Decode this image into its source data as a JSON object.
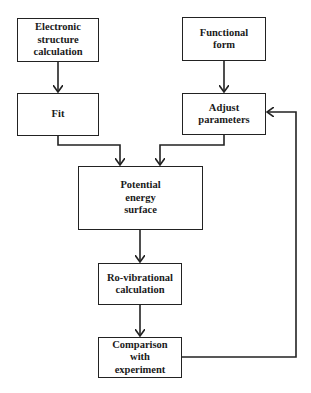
{
  "diagram": {
    "type": "flowchart",
    "nodes": [
      {
        "id": "electronic",
        "label": "Electronic\nstructure\ncalculation"
      },
      {
        "id": "functional",
        "label": "Functional\nform"
      },
      {
        "id": "fit",
        "label": "Fit"
      },
      {
        "id": "adjust",
        "label": "Adjust\nparameters"
      },
      {
        "id": "pes",
        "label": "Potential\nenergy\nsurface"
      },
      {
        "id": "rovib",
        "label": "Ro-vibrational\ncalculation"
      },
      {
        "id": "comparison",
        "label": "Comparison\nwith\nexperiment"
      }
    ],
    "edges": [
      {
        "from": "electronic",
        "to": "fit"
      },
      {
        "from": "functional",
        "to": "adjust"
      },
      {
        "from": "fit",
        "to": "pes"
      },
      {
        "from": "adjust",
        "to": "pes"
      },
      {
        "from": "pes",
        "to": "rovib"
      },
      {
        "from": "rovib",
        "to": "comparison"
      },
      {
        "from": "comparison",
        "to": "adjust",
        "style": "feedback-loop"
      }
    ],
    "colors": {
      "line": "#222222",
      "background": "#ffffff"
    }
  }
}
